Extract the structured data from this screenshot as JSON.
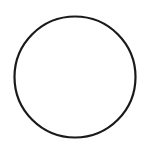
{
  "shape": {
    "type": "circle",
    "cx": 75,
    "cy": 77,
    "r": 60.5,
    "stroke": "#1a1a1a",
    "stroke_width": 2.2,
    "fill": "none"
  },
  "background": "#ffffff"
}
